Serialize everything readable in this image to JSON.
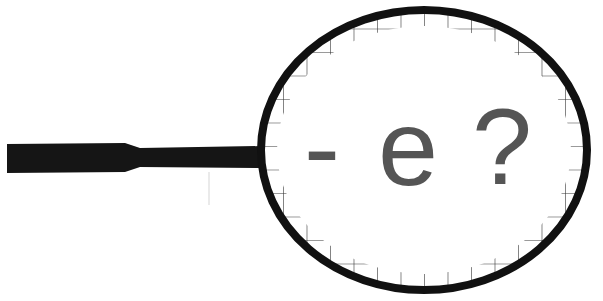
{
  "illustration": {
    "subject": "magnifying-glass",
    "lens_text": {
      "dash": "-",
      "letter": "e",
      "question": "?"
    },
    "colors": {
      "background": "#ffffff",
      "frame": "#111111",
      "handle": "#151515",
      "grid": "#333333",
      "text": "#555555"
    }
  }
}
